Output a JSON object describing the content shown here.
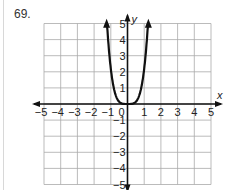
{
  "problem": {
    "number": "69."
  },
  "chart_data": {
    "type": "line",
    "title": "",
    "xlabel": "x",
    "ylabel": "y",
    "xlim": [
      -5,
      5
    ],
    "ylim": [
      -5,
      5
    ],
    "grid": true,
    "x_ticks": [
      "-5",
      "-4",
      "-3",
      "-2",
      "-1",
      "0",
      "1",
      "2",
      "3",
      "4",
      "5"
    ],
    "y_ticks": [
      "5",
      "4",
      "3",
      "2",
      "1",
      "-1",
      "-2",
      "-3",
      "-4",
      "-5"
    ],
    "series": [
      {
        "name": "curve",
        "description": "even-degree polynomial (quartic-like), flat near origin, arrows upward at both ends",
        "x": [
          -1.25,
          -1.1,
          -1.0,
          -0.8,
          -0.6,
          -0.4,
          -0.2,
          0,
          0.2,
          0.4,
          0.6,
          0.8,
          1.0,
          1.1,
          1.25
        ],
        "y": [
          4.9,
          2.9,
          2.0,
          0.8,
          0.26,
          0.05,
          0.0,
          0,
          0.0,
          0.05,
          0.26,
          0.8,
          2.0,
          2.9,
          4.9
        ]
      }
    ],
    "colors": {
      "grid": "#aaaaaa",
      "axis": "#111111",
      "curve": "#111111"
    }
  }
}
